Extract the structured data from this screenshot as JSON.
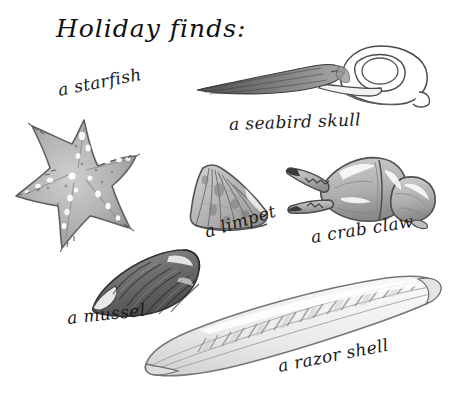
{
  "page": {
    "background_color": "#ffffff",
    "ink_color": "#1a1a1a",
    "medium": "pencil-and-grey-wash-sketch",
    "title": "Holiday finds:"
  },
  "labels": {
    "starfish": "a starfish",
    "seabird_skull": "a seabird skull",
    "limpet": "a limpet",
    "crab_claw": "a crab claw",
    "mussel": "a mussel",
    "razor_shell": "a razor shell"
  },
  "specimens": [
    {
      "name": "starfish",
      "label": "a starfish",
      "icon": "starfish-icon",
      "description": "five-armed sea star, mottled grey wash with white speckles and bristled arm edges",
      "palette": {
        "fill": "#b7b7b7",
        "shade": "#8f8f8f",
        "outline": "#5b5b5b",
        "highlight": "#ffffff"
      }
    },
    {
      "name": "seabird-skull",
      "label": "a seabird skull",
      "icon": "skull-icon",
      "description": "long dark tapering beak pointing left, rounded cranium with large eye socket at right",
      "palette": {
        "fill": "#ffffff",
        "shade": "#8a8a8a",
        "outline": "#4a4a4a",
        "beak": "#6b6b6b"
      }
    },
    {
      "name": "limpet",
      "label": "a limpet",
      "icon": "shell-icon",
      "description": "fan-shaped conical shell with radiating ribs, grey wash",
      "palette": {
        "fill": "#c2c2c2",
        "shade": "#949494",
        "outline": "#555555"
      }
    },
    {
      "name": "crab-claw",
      "label": "a crab claw",
      "icon": "claw-icon",
      "description": "pincer opening to the left with serrated dark tips and jointed segment at right",
      "palette": {
        "fill": "#bdbdbd",
        "shade": "#8d8d8d",
        "outline": "#4f4f4f",
        "tips": "#3a3a3a"
      }
    },
    {
      "name": "mussel",
      "label": "a mussel",
      "icon": "mussel-icon",
      "description": "dark elongated bivalve tapering to a pale point at lower left, banded growth lines",
      "palette": {
        "fill": "#7f7f7f",
        "shade": "#4e4e4e",
        "outline": "#3a3a3a",
        "highlight": "#efefef"
      }
    },
    {
      "name": "razor-shell",
      "label": "a razor shell",
      "icon": "razor-shell-icon",
      "description": "long slender blade-like shell lying diagonally, pale with fine striped banding",
      "palette": {
        "fill": "#e6e6e6",
        "shade": "#b5b5b5",
        "outline": "#777777"
      }
    }
  ]
}
